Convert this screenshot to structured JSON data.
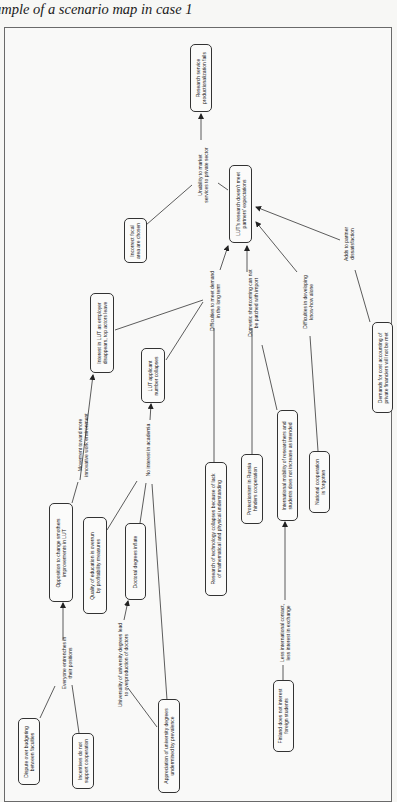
{
  "caption": "ample of a scenario map in case 1",
  "colors": {
    "line": "#333333",
    "box_border": "#333333",
    "background": "#f9f9f8"
  },
  "nodes": {
    "n1": {
      "lines": [
        "Research service",
        "productionalization fails"
      ]
    },
    "n2": {
      "lines": [
        "LUT's research doesn't meet",
        "partners' expectations"
      ]
    },
    "n3": {
      "lines": [
        "Incorrect focal",
        "area are chosen"
      ]
    },
    "n4": {
      "lines": [
        "Interest in LUT as employer",
        "disappears, top actors leave"
      ]
    },
    "n5": {
      "lines": [
        "LUT applicant",
        "number collapses"
      ]
    },
    "n6": {
      "lines": [
        "Demands for cost accounting of",
        "private financiers will not be met"
      ]
    },
    "n7": {
      "lines": [
        "International mobility of researchers and",
        "students does not increase as intended"
      ]
    },
    "n8": {
      "lines": [
        "Protectionism in Russia",
        "hinders cooperation"
      ]
    },
    "n9": {
      "lines": [
        "National cooperation",
        "is forgotten"
      ]
    },
    "n10": {
      "lines": [
        "Research of technology collapses because of lack",
        "of mathematical and physical understanding"
      ]
    },
    "n11": {
      "lines": [
        "Opposition to change smothers",
        "improvements in LUT"
      ]
    },
    "n12": {
      "lines": [
        "Quality of education is overrun",
        "by profitability measures"
      ]
    },
    "n13": {
      "lines": [
        "Doctoral degrees inflate"
      ]
    },
    "n14": {
      "lines": [
        "Finland does not interest",
        "foreign students"
      ]
    },
    "n15": {
      "lines": [
        "Dispute over budgeting",
        "between faculties"
      ]
    },
    "n16": {
      "lines": [
        "Incentives do not",
        "support cooperation"
      ]
    },
    "n17": {
      "lines": [
        "Appreciation of university degrees",
        "undermined by prevalence"
      ]
    }
  },
  "edge_labels": {
    "e1": {
      "lines": [
        "Unability to market",
        "services to private sector"
      ]
    },
    "e2": {
      "lines": [
        "Difficulties to meet demand",
        "in the long term"
      ]
    },
    "e3": {
      "lines": [
        "Domestic shortcoming can not",
        "be patched with import"
      ]
    },
    "e4": {
      "lines": [
        "Difficulties in developing",
        "know-how alone"
      ]
    },
    "e5": {
      "lines": [
        "Adds to partner",
        "dissatisfaction"
      ]
    },
    "e6": {
      "lines": [
        "Movement toward more",
        "innovative work environment"
      ]
    },
    "e7": {
      "lines": [
        "No interest in academia"
      ]
    },
    "e8": {
      "lines": [
        "Everyone entrenches in",
        "their positions"
      ]
    },
    "e9": {
      "lines": [
        "Universality of university degrees lead",
        "to overproduction of doctors"
      ]
    },
    "e10": {
      "lines": [
        "Less international contact,",
        "less interest in exchange"
      ]
    }
  }
}
